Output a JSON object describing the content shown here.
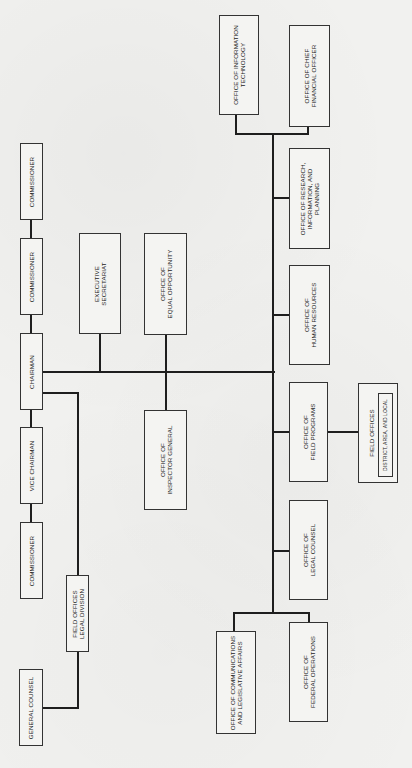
{
  "chart": {
    "orientation": "rotated-90-ccw",
    "commission": {
      "commissioner_top": "COMMISSIONER",
      "commissioner_2": "COMMISSIONER",
      "chairman": "CHAIRMAN",
      "vice_chairman": "VICE CHAIRMAN",
      "commissioner_3": "COMMISSIONER",
      "general_counsel": "GENERAL COUNSEL",
      "field_offices_legal": "FIELD OFFICES\nLEGAL DIVISION"
    },
    "staff": {
      "executive_secretariat": "EXECUTIVE\nSECRETARIAT",
      "equal_opportunity": "OFFICE OF\nEQUAL OPPORTUNITY",
      "inspector_general": "OFFICE OF\nINSPECTOR GENERAL"
    },
    "offices": {
      "information_technology": "OFFICE OF INFORMATION\nTECHNOLOGY",
      "chief_financial_officer": "OFFICE OF CHIEF\nFINANCIAL OFFICER",
      "research": "OFFICE OF RESEARCH,\nINFORMATION, AND\nPLANNING",
      "human_resources": "OFFICE OF\nHUMAN RESOURCES",
      "field_programs": "OFFICE OF\nFIELD PROGRAMS",
      "legal_counsel": "OFFICE OF\nLEGAL COUNSEL",
      "communications": "OFFICE OF COMMUNICATIONS\nAND LEGISLATIVE AFFAIRS",
      "federal_operations": "OFFICE OF\nFEDERAL OPERATIONS"
    },
    "field_offices": {
      "title": "FIELD OFFICES",
      "subtitle": "DISTRICT, AREA, AND LOCAL"
    }
  }
}
